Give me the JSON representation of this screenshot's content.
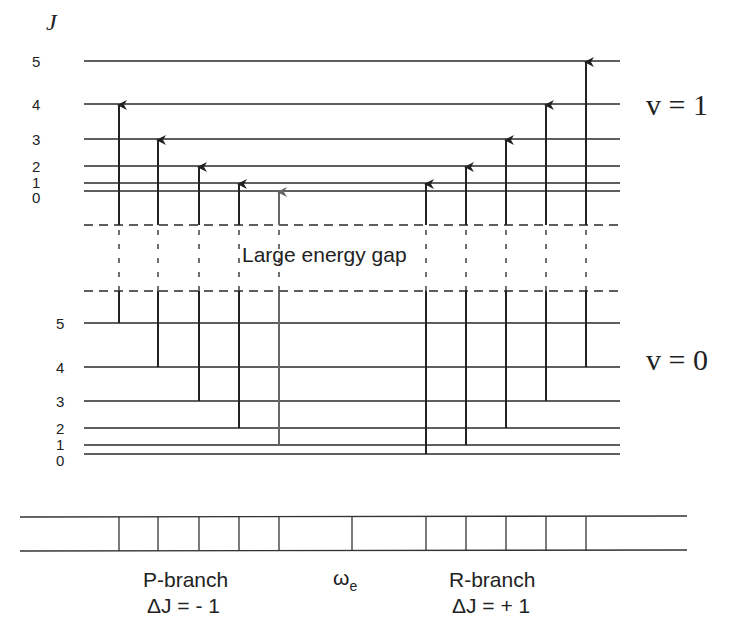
{
  "diagram": {
    "title_axis_label": "J",
    "upper_state": {
      "label": "v = 1",
      "levels": [
        {
          "J": "5",
          "y": 61
        },
        {
          "J": "4",
          "y": 104
        },
        {
          "J": "3",
          "y": 139
        },
        {
          "J": "2",
          "y": 166
        },
        {
          "J": "1",
          "y": 183
        },
        {
          "J": "0",
          "y": 191
        }
      ],
      "dashed_y": 225
    },
    "lower_state": {
      "label": "v = 0",
      "levels": [
        {
          "J": "5",
          "y": 323
        },
        {
          "J": "4",
          "y": 367
        },
        {
          "J": "3",
          "y": 401
        },
        {
          "J": "2",
          "y": 428
        },
        {
          "J": "1",
          "y": 445
        },
        {
          "J": "0",
          "y": 454
        }
      ],
      "dashed_y": 291
    },
    "gap_label": "Large energy gap",
    "p_branch": {
      "label": "P-branch",
      "rule": "ΔJ = - 1",
      "transitions": [
        {
          "x": 119,
          "from_J": 5,
          "to_J": 4
        },
        {
          "x": 158,
          "from_J": 4,
          "to_J": 3
        },
        {
          "x": 199,
          "from_J": 3,
          "to_J": 2
        },
        {
          "x": 239,
          "from_J": 2,
          "to_J": 1
        },
        {
          "x": 279,
          "from_J": 1,
          "to_J": 0,
          "faint": true
        }
      ]
    },
    "r_branch": {
      "label": "R-branch",
      "rule": "ΔJ = + 1",
      "transitions": [
        {
          "x": 426,
          "from_J": 0,
          "to_J": 1
        },
        {
          "x": 466,
          "from_J": 1,
          "to_J": 2
        },
        {
          "x": 506,
          "from_J": 2,
          "to_J": 3
        },
        {
          "x": 546,
          "from_J": 3,
          "to_J": 4
        },
        {
          "x": 586,
          "from_J": 4,
          "to_J": 5
        }
      ]
    },
    "band_origin_label": "ω",
    "band_origin_subscript": "e",
    "spectrum": {
      "p_lines_x": [
        119,
        158,
        199,
        239,
        279
      ],
      "origin_gap_line_x": 352,
      "r_lines_x": [
        426,
        466,
        506,
        546,
        586
      ]
    }
  }
}
